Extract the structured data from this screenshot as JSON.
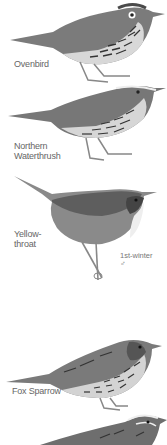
{
  "birds": [
    {
      "name": "Ovenbird",
      "label": "Ovenbird"
    },
    {
      "name": "Northern Waterthrush",
      "label_line1": "Northern",
      "label_line2": "Waterthrush"
    },
    {
      "name": "Yellowthroat",
      "label_line1": "Yellow-",
      "label_line2": "throat",
      "note_line1": "1st-winter",
      "note_line2": "♂"
    },
    {
      "name": "Fox Sparrow",
      "label": "Fox Sparrow"
    },
    {
      "name": "partial sparrow"
    }
  ],
  "colors": {
    "background": "#ffffff",
    "bird_dark": "#555555",
    "bird_mid": "#8a8a8a",
    "bird_light": "#cfcfcf",
    "label": "#666666"
  }
}
